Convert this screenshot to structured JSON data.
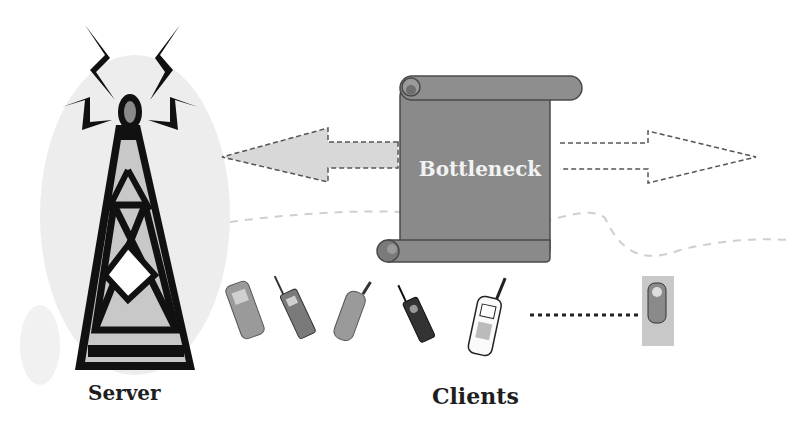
{
  "diagram": {
    "server": {
      "label": "Server",
      "icon": "radio-tower-icon"
    },
    "bottleneck": {
      "label": "Bottleneck",
      "icon": "scroll-icon",
      "fill": "#8a8a8a"
    },
    "clients": {
      "label": "Clients",
      "devices": [
        {
          "icon": "mobile-phone-icon"
        },
        {
          "icon": "mobile-phone-icon"
        },
        {
          "icon": "mobile-phone-icon"
        },
        {
          "icon": "mobile-phone-icon"
        },
        {
          "icon": "mobile-phone-icon"
        },
        {
          "icon": "mobile-phone-icon"
        }
      ],
      "ellipsis": "dotted-line"
    },
    "arrows": [
      {
        "direction": "left",
        "fill": "#d6d6d6",
        "stroke": "dashed"
      },
      {
        "direction": "right",
        "fill": "#ffffff",
        "stroke": "dashed"
      }
    ],
    "colors": {
      "ink": "#111111",
      "tower_fill": "#c8c8c8",
      "halo": "#ececec",
      "scroll": "#8a8a8a"
    }
  }
}
